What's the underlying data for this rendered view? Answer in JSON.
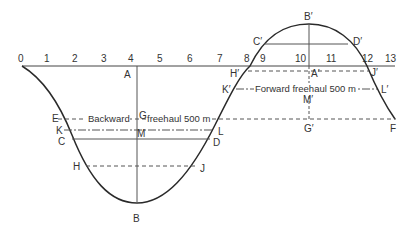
{
  "diagram": {
    "type": "mass-haul diagram",
    "colors": {
      "line": "#333333",
      "curve": "#2a2a2a",
      "background": "#ffffff"
    },
    "axis": {
      "ticks": [
        "0",
        "1",
        "2",
        "3",
        "4",
        "5",
        "6",
        "7",
        "8",
        "9",
        "10",
        "11",
        "12",
        "13"
      ]
    },
    "points": {
      "A": "A",
      "B": "B",
      "C": "C",
      "D": "D",
      "E": "E",
      "F": "F",
      "G": "G",
      "H": "H",
      "J": "J",
      "K": "K",
      "L": "L",
      "M": "M",
      "A_prime": "A′",
      "B_prime": "B′",
      "C_prime": "C′",
      "D_prime": "D′",
      "G_prime": "G′",
      "H_prime": "H′",
      "J_prime": "J′",
      "K_prime": "K′",
      "L_prime": "L′",
      "M_prime": "M′"
    },
    "annotations": {
      "backward_left": "Backward",
      "backward_right": "freehaul 500 m",
      "forward": "Forward freehaul 500 m"
    }
  }
}
